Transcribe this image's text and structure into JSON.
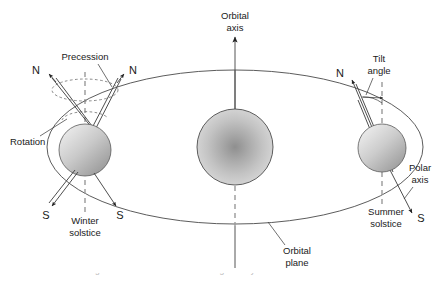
{
  "figure": {
    "background_color": "#ffffff",
    "stroke_color": "#333333",
    "body_fill_light": "#f0f0f0",
    "body_fill_dark": "#9f9f9f",
    "partial_caption": "Fig. 1 Earth's orbital and rotational geometry"
  },
  "labels": {
    "orbital_axis_line1": "Orbital",
    "orbital_axis_line2": "axis",
    "precession": "Precession",
    "rotation": "Rotation",
    "tilt_angle_line1": "Tilt",
    "tilt_angle_line2": "angle",
    "polar_axis_line1": "Polar",
    "polar_axis_line2": "axis",
    "winter_solstice_line1": "Winter",
    "winter_solstice_line2": "solstice",
    "summer_solstice_line1": "Summer",
    "summer_solstice_line2": "solstice",
    "orbital_plane_line1": "Orbital",
    "orbital_plane_line2": "plane",
    "north_pole_left_a": "N",
    "north_pole_left_b": "N",
    "south_pole_left_a": "S",
    "south_pole_left_b": "S",
    "north_pole_right": "N",
    "south_pole_right": "S"
  },
  "geometry": {
    "orbit_center_x": 235,
    "orbit_center_y": 147,
    "orbit_rx": 188,
    "orbit_ry": 77,
    "sun_center_x": 235,
    "sun_center_y": 147,
    "sun_radius": 38,
    "earth_winter_x": 85,
    "earth_winter_y": 150,
    "earth_winter_radius": 26,
    "earth_summer_x": 382,
    "earth_summer_y": 148,
    "earth_summer_radius": 24,
    "axial_tilt_degrees": 23.5
  }
}
